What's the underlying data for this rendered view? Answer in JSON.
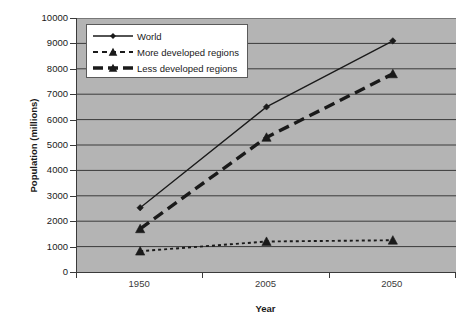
{
  "chart_data": {
    "type": "line",
    "title": "",
    "xlabel": "Year",
    "ylabel": "Population (millions)",
    "categories": [
      "1950",
      "2005",
      "2050"
    ],
    "ylim": [
      0,
      10000
    ],
    "ytick_step": 1000,
    "yticks": [
      "10000",
      "9000",
      "8000",
      "7000",
      "6000",
      "5000",
      "4000",
      "3000",
      "2000",
      "1000",
      "0"
    ],
    "grid": true,
    "legend_position": "top-left",
    "series": [
      {
        "name": "World",
        "values": [
          2530,
          6500,
          9100
        ],
        "line_style": "solid",
        "marker": "diamond",
        "color": "#1a1a1a"
      },
      {
        "name": "More developed regions",
        "values": [
          820,
          1200,
          1250
        ],
        "line_style": "dotted",
        "marker": "triangle",
        "color": "#1a1a1a"
      },
      {
        "name": "Less developed regions",
        "values": [
          1700,
          5300,
          7800
        ],
        "line_style": "dashed",
        "marker": "triangle",
        "color": "#1a1a1a"
      }
    ]
  },
  "legend": {
    "items": [
      {
        "label": "World"
      },
      {
        "label": "More developed regions"
      },
      {
        "label": "Less developed regions"
      }
    ]
  },
  "axes": {
    "x_title": "Year",
    "y_title": "Population (millions)",
    "x_categories": [
      "1950",
      "2005",
      "2050"
    ],
    "y_labels": [
      "10000",
      "9000",
      "8000",
      "7000",
      "6000",
      "5000",
      "4000",
      "3000",
      "2000",
      "1000",
      "0"
    ]
  },
  "colors": {
    "plot_background": "#b4b4b4",
    "grid_line": "#3a3a3a",
    "series_line": "#1a1a1a",
    "page_background": "#ffffff",
    "legend_background": "#ffffff"
  }
}
